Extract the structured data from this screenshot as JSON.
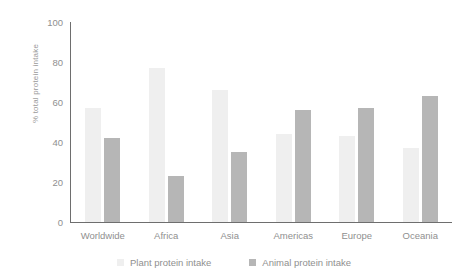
{
  "chart_data": {
    "type": "bar",
    "title": "",
    "subtitle": "",
    "xlabel": "",
    "ylabel": "% total protein intake",
    "ylim": [
      0,
      100
    ],
    "yticks": [
      0,
      20,
      40,
      60,
      80,
      100
    ],
    "grid": false,
    "legend_position": "bottom",
    "categories": [
      "Worldwide",
      "Africa",
      "Asia",
      "Americas",
      "Europe",
      "Oceania"
    ],
    "series": [
      {
        "name": "Plant protein intake",
        "color": "#efefef",
        "values": [
          57,
          77,
          66,
          44,
          43,
          37
        ]
      },
      {
        "name": "Animal protein intake",
        "color": "#b6b6b6",
        "values": [
          42,
          23,
          35,
          56,
          57,
          63
        ]
      }
    ]
  },
  "axis": {
    "tick_0": "0",
    "tick_20": "20",
    "tick_40": "40",
    "tick_60": "60",
    "tick_80": "80",
    "tick_100": "100"
  },
  "colors": {
    "plant": "#efefef",
    "animal": "#b6b6b6",
    "axis": "#6e6e6e",
    "text": "#8f8f8f",
    "background": "#ffffff"
  }
}
